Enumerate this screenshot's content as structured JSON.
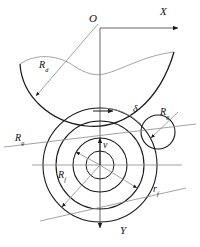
{
  "figure": {
    "kind": "engineering-geometry-diagram",
    "background_color": "#ffffff",
    "line_color": "#1a1a1a",
    "thin_line_color": "#8c8c8c"
  },
  "axes": {
    "origin_label": "O",
    "x_label": "X",
    "y_label": "Y"
  },
  "labels": {
    "curve_radius": {
      "symbol": "R",
      "subscript": "d"
    },
    "angle": {
      "symbol": "δ"
    },
    "small_circle_radius": {
      "symbol": "R",
      "subscript": "g"
    },
    "outer_circle_radius": {
      "symbol": "R",
      "subscript": "g"
    },
    "inner_circle_radius": {
      "symbol": "R",
      "subscript": "f"
    },
    "mid_circle_radius": {
      "symbol": "r",
      "subscript": "f"
    },
    "velocity": {
      "symbol": "v"
    }
  },
  "geometry": {
    "origin": {
      "x": 100,
      "y": 28
    },
    "center": {
      "x": 100,
      "y": 165
    },
    "circles": [
      {
        "name": "outer",
        "r": 57
      },
      {
        "name": "middle",
        "r": 44
      },
      {
        "name": "inner",
        "r": 27
      },
      {
        "name": "hub",
        "r": 14
      }
    ],
    "small_circle": {
      "cx": 158,
      "cy": 132,
      "r": 17
    },
    "x_axis_end": {
      "x": 183,
      "y": 28
    },
    "y_axis_end": {
      "x": 100,
      "y": 233
    }
  }
}
